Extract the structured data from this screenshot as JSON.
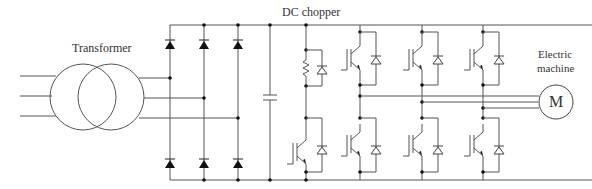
{
  "labels": {
    "transformer": "Transformer",
    "dc_chopper": "DC chopper",
    "machine_line1": "Electric",
    "machine_line2": "machine",
    "motor_symbol": "M"
  },
  "components": {
    "transformer": {
      "type": "three-phase transformer",
      "inputs": 3,
      "outputs": 3
    },
    "rectifier": {
      "type": "diode bridge",
      "diodes": 6,
      "legs": 3
    },
    "dc_link": {
      "type": "capacitor"
    },
    "chopper": {
      "type": "DC chopper",
      "parts": [
        "resistor",
        "freewheel diode",
        "IGBT with antiparallel diode"
      ]
    },
    "inverter": {
      "type": "IGBT inverter",
      "legs": 3,
      "switches": 6
    },
    "machine": {
      "type": "electric machine",
      "phases": 3
    }
  },
  "colors": {
    "wire": "#555555",
    "node": "#111111",
    "background": "#ffffff"
  }
}
